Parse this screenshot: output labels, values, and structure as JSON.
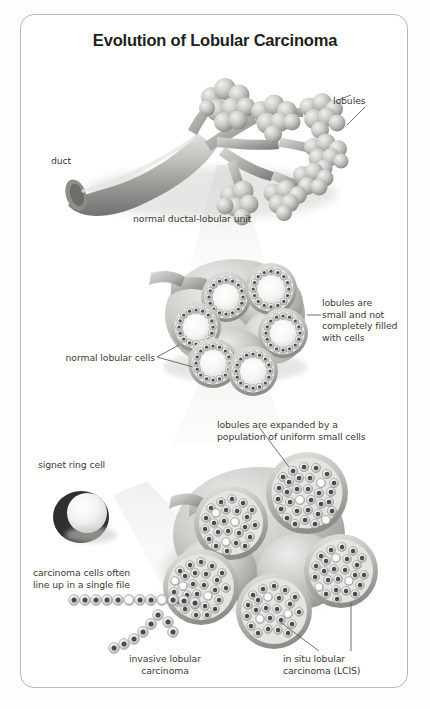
{
  "figure": {
    "title": "Evolution of Lobular Carcinoma",
    "border_color": "#b9b9b9",
    "background_color": "#ffffff",
    "page_background": "#fdfdfd",
    "text_color": "#3c3a38",
    "title_color": "#231f20",
    "illustration_palette": {
      "duct_light": "#d8d8d6",
      "duct_mid": "#a9a9a6",
      "duct_dark": "#6e6e6b",
      "lobule_light": "#d5d5d2",
      "lobule_dark": "#8f8f8c",
      "cell_ring": "#e9e9e6",
      "cell_nucleus": "#4a4a48",
      "lumen": "#fbfbfa",
      "shadow": "#c9c9c6",
      "cone": "#ededeb"
    }
  },
  "labels": {
    "lobules": "lobules",
    "duct": "duct",
    "normal_unit": "normal ductal-lobular unit",
    "lobules_small": "lobules are\nsmall and not\ncompletely filled\nwith cells",
    "normal_lobular_cells": "normal lobular cells",
    "lobules_expanded": "lobules are expanded by a\npopulation of uniform small cells",
    "signet_ring_cell": "signet ring cell",
    "single_file": "carcinoma cells often\nline up in a single file",
    "invasive": "invasive lobular\ncarcinoma",
    "in_situ": "in situ lobular\ncarcinoma (LCIS)"
  },
  "diagram_stages": [
    {
      "name": "normal-ductal-lobular-unit",
      "caption": "normal ductal-lobular unit",
      "description": "Branching duct with grape-like clusters of lobules"
    },
    {
      "name": "normal-lobular-cells-cross-section",
      "caption": "lobules are small and not completely filled with cells",
      "description": "Six circular lobule cross-sections each with a ring of cells around a hollow lumen"
    },
    {
      "name": "lobular-carcinoma-in-situ",
      "caption": "lobules are expanded by a population of uniform small cells",
      "description": "Enlarged lobule cross-sections completely packed with uniform small cells"
    },
    {
      "name": "invasive-lobular-carcinoma",
      "caption": "carcinoma cells often line up in a single file",
      "description": "Chain of carcinoma cells streaming away from the lobules in single file"
    }
  ]
}
